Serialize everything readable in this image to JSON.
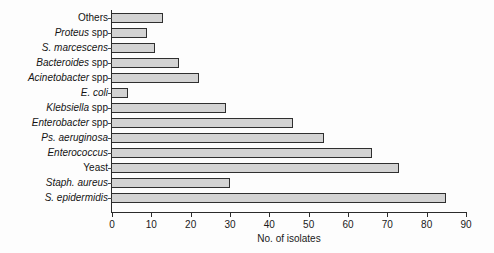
{
  "chart_data": {
    "type": "bar",
    "orientation": "horizontal",
    "title": "",
    "xlabel": "No. of isolates",
    "ylabel": "",
    "xlim": [
      0,
      90
    ],
    "xticks": [
      0,
      10,
      20,
      30,
      40,
      50,
      60,
      70,
      80,
      90
    ],
    "grid": false,
    "legend": false,
    "bar_fill_color": "#d3d3d3",
    "bar_edge_color": "#2f2f2f",
    "categories": [
      "Others",
      "Proteus spp",
      "S. marcescens",
      "Bacteroides spp",
      "Acinetobacter spp",
      "E. coli",
      "Klebsiella spp",
      "Enterobacter spp",
      "Ps. aeruginosa",
      "Enterococcus",
      "Yeast",
      "Staph. aureus",
      "S. epidermidis"
    ],
    "values": [
      13,
      9,
      11,
      17,
      22,
      4,
      29,
      46,
      54,
      66,
      73,
      30,
      85
    ],
    "category_parts": [
      {
        "italic": "",
        "roman": "Others"
      },
      {
        "italic": "Proteus",
        "roman": " spp"
      },
      {
        "italic": "S. marcescens",
        "roman": ""
      },
      {
        "italic": "Bacteroides",
        "roman": " spp"
      },
      {
        "italic": "Acinetobacter",
        "roman": " spp"
      },
      {
        "italic": "E. coli",
        "roman": ""
      },
      {
        "italic": "Klebsiella",
        "roman": " spp"
      },
      {
        "italic": "Enterobacter",
        "roman": " spp"
      },
      {
        "italic": "Ps. aeruginosa",
        "roman": ""
      },
      {
        "italic": "Enterococcus",
        "roman": ""
      },
      {
        "italic": "",
        "roman": "Yeast"
      },
      {
        "italic": "Staph. aureus",
        "roman": ""
      },
      {
        "italic": "S. epidermidis",
        "roman": ""
      }
    ]
  }
}
